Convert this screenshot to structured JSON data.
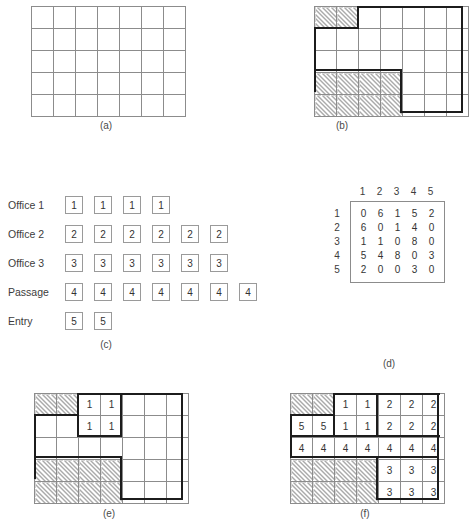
{
  "figure": {
    "panels": [
      "(a)",
      "(b)",
      "(c)",
      "(d)",
      "(e)",
      "(f)"
    ]
  },
  "panel_a": {
    "caption": "(a)",
    "cols": 7,
    "rows": 5,
    "cells": [
      [
        "",
        "",
        "",
        "",
        "",
        "",
        ""
      ],
      [
        "",
        "",
        "",
        "",
        "",
        "",
        ""
      ],
      [
        "",
        "",
        "",
        "",
        "",
        "",
        ""
      ],
      [
        "",
        "",
        "",
        "",
        "",
        "",
        ""
      ],
      [
        "",
        "",
        "",
        "",
        "",
        "",
        ""
      ]
    ],
    "hatched": [
      [
        false,
        false,
        false,
        false,
        false,
        false,
        false
      ],
      [
        false,
        false,
        false,
        false,
        false,
        false,
        false
      ],
      [
        false,
        false,
        false,
        false,
        false,
        false,
        false
      ],
      [
        false,
        false,
        false,
        false,
        false,
        false,
        false
      ],
      [
        false,
        false,
        false,
        false,
        false,
        false,
        false
      ]
    ]
  },
  "panel_b": {
    "caption": "(b)",
    "cols": 7,
    "rows": 5,
    "cells": [
      [
        "",
        "",
        "",
        "",
        "",
        "",
        ""
      ],
      [
        "",
        "",
        "",
        "",
        "",
        "",
        ""
      ],
      [
        "",
        "",
        "",
        "",
        "",
        "",
        ""
      ],
      [
        "",
        "",
        "",
        "",
        "",
        "",
        ""
      ],
      [
        "",
        "",
        "",
        "",
        "",
        "",
        ""
      ]
    ],
    "hatched": [
      [
        true,
        true,
        false,
        false,
        false,
        false,
        false
      ],
      [
        false,
        false,
        false,
        false,
        false,
        false,
        false
      ],
      [
        false,
        false,
        false,
        false,
        false,
        false,
        false
      ],
      [
        true,
        true,
        true,
        true,
        false,
        false,
        false
      ],
      [
        true,
        true,
        true,
        true,
        false,
        false,
        false
      ]
    ]
  },
  "panel_c": {
    "caption": "(c)",
    "rows": [
      {
        "label": "Office 1",
        "value": "1",
        "count": 4
      },
      {
        "label": "Office 2",
        "value": "2",
        "count": 6
      },
      {
        "label": "Office 3",
        "value": "3",
        "count": 6
      },
      {
        "label": "Passage",
        "value": "4",
        "count": 7
      },
      {
        "label": "Entry",
        "value": "5",
        "count": 2
      }
    ]
  },
  "panel_d": {
    "caption": "(d)",
    "col_headers": [
      "1",
      "2",
      "3",
      "4",
      "5"
    ],
    "row_headers": [
      "1",
      "2",
      "3",
      "4",
      "5"
    ],
    "matrix": [
      [
        "0",
        "6",
        "1",
        "5",
        "2"
      ],
      [
        "6",
        "0",
        "1",
        "4",
        "0"
      ],
      [
        "1",
        "1",
        "0",
        "8",
        "0"
      ],
      [
        "5",
        "4",
        "8",
        "0",
        "3"
      ],
      [
        "2",
        "0",
        "0",
        "3",
        "0"
      ]
    ]
  },
  "panel_e": {
    "caption": "(e)",
    "cols": 7,
    "rows": 5,
    "cells": [
      [
        "",
        "",
        "1",
        "1",
        "",
        "",
        ""
      ],
      [
        "",
        "",
        "1",
        "1",
        "",
        "",
        ""
      ],
      [
        "",
        "",
        "",
        "",
        "",
        "",
        ""
      ],
      [
        "",
        "",
        "",
        "",
        "",
        "",
        ""
      ],
      [
        "",
        "",
        "",
        "",
        "",
        "",
        ""
      ]
    ],
    "hatched": [
      [
        true,
        true,
        false,
        false,
        false,
        false,
        false
      ],
      [
        false,
        false,
        false,
        false,
        false,
        false,
        false
      ],
      [
        false,
        false,
        false,
        false,
        false,
        false,
        false
      ],
      [
        true,
        true,
        true,
        true,
        false,
        false,
        false
      ],
      [
        true,
        true,
        true,
        true,
        false,
        false,
        false
      ]
    ]
  },
  "panel_f": {
    "caption": "(f)",
    "cols": 7,
    "rows": 5,
    "cells": [
      [
        "",
        "",
        "1",
        "1",
        "2",
        "2",
        "2"
      ],
      [
        "5",
        "5",
        "1",
        "1",
        "2",
        "2",
        "2"
      ],
      [
        "4",
        "4",
        "4",
        "4",
        "4",
        "4",
        "4"
      ],
      [
        "",
        "",
        "",
        "",
        "3",
        "3",
        "3"
      ],
      [
        "",
        "",
        "",
        "",
        "3",
        "3",
        "3"
      ]
    ],
    "hatched": [
      [
        true,
        true,
        false,
        false,
        false,
        false,
        false
      ],
      [
        false,
        false,
        false,
        false,
        false,
        false,
        false
      ],
      [
        false,
        false,
        false,
        false,
        false,
        false,
        false
      ],
      [
        true,
        true,
        true,
        true,
        false,
        false,
        false
      ],
      [
        true,
        true,
        true,
        true,
        false,
        false,
        false
      ]
    ]
  },
  "colors": {
    "grid_line": "#8c8c8c",
    "thick_line": "#1c1c1c",
    "hatch": "#555555",
    "text": "#333333"
  }
}
